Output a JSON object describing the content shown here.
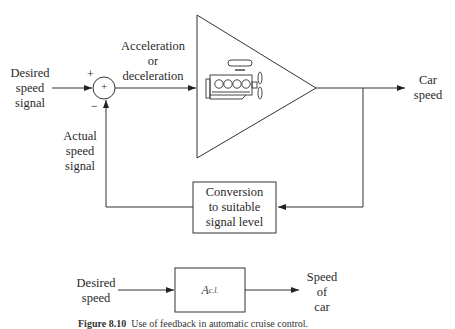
{
  "diagram": {
    "type": "feedback-block-diagram",
    "top": {
      "input_label": [
        "Desired",
        "speed",
        "signal"
      ],
      "summing_junction": {
        "symbol": "+",
        "plus_sign": "+",
        "minus_sign": "−"
      },
      "forward_label": [
        "Acceleration",
        "or",
        "deceleration"
      ],
      "amplifier_block": {
        "shape": "triangle",
        "icon": "car-engine-icon"
      },
      "output_label": [
        "Car",
        "speed"
      ],
      "feedback_block_label": [
        "Conversion",
        "to suitable",
        "signal level"
      ],
      "feedback_signal_label": [
        "Actual",
        "speed",
        "signal"
      ]
    },
    "bottom": {
      "input_label": [
        "Desired",
        "speed"
      ],
      "block_label_main": "A",
      "block_label_sub": "c.l.",
      "output_label": [
        "Speed",
        "of",
        "car"
      ]
    },
    "caption": {
      "prefix": "Figure 8.10",
      "text": "Use of feedback in automatic cruise control."
    }
  }
}
